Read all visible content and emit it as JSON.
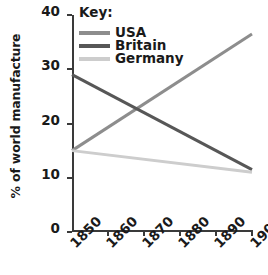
{
  "chart_data": {
    "type": "line",
    "title": "",
    "xlabel": "",
    "ylabel": "% of world manufacture",
    "x": [
      1850,
      1900
    ],
    "xlim": [
      1850,
      1900
    ],
    "ylim": [
      0,
      40
    ],
    "xticks": [
      "1850",
      "1860",
      "1870",
      "1880",
      "1890",
      "1900"
    ],
    "yticks": [
      "0",
      "10",
      "20",
      "30",
      "40"
    ],
    "grid": false,
    "legend_position": "top-left",
    "legend_title": "Key:",
    "series": [
      {
        "name": "USA",
        "color": "#8d8d8d",
        "x": [
          1850,
          1900
        ],
        "values": [
          15,
          36.5
        ]
      },
      {
        "name": "Britain",
        "color": "#575757",
        "x": [
          1850,
          1900
        ],
        "values": [
          29,
          11.5
        ]
      },
      {
        "name": "Germany",
        "color": "#cdcdcd",
        "x": [
          1850,
          1900
        ],
        "values": [
          15,
          11
        ]
      }
    ]
  },
  "axes": {
    "y_title": "% of world manufacture",
    "y_tick_labels": [
      "40",
      "30",
      "20",
      "10",
      "0"
    ],
    "y_tick_values": [
      40,
      30,
      20,
      10,
      0
    ],
    "x_tick_labels": [
      "1850",
      "1860",
      "1870",
      "1880",
      "1890",
      "1900"
    ],
    "x_tick_values": [
      1850,
      1860,
      1870,
      1880,
      1890,
      1900
    ]
  },
  "legend": {
    "title": "Key:",
    "items": [
      {
        "label": "USA",
        "color": "#8d8d8d"
      },
      {
        "label": "Britain",
        "color": "#575757"
      },
      {
        "label": "Germany",
        "color": "#cdcdcd"
      }
    ]
  }
}
